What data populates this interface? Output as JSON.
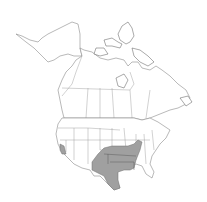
{
  "map": {
    "type": "species-range-map",
    "region": "North America",
    "colors": {
      "background": "#ffffff",
      "land": "#ffffff",
      "borders": "#8a8a8a",
      "range_fill": "#a0a0a0"
    },
    "range_areas": [
      {
        "name": "south-central-range",
        "description": "Texas, Oklahoma, Kansas, New Mexico (east), Arkansas, Louisiana (north), Missouri, Illinois (south)"
      },
      {
        "name": "southern-california-range",
        "description": "Southern California patch"
      }
    ]
  }
}
